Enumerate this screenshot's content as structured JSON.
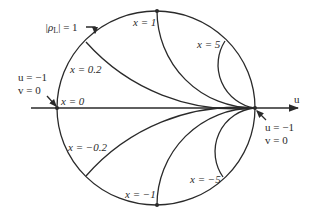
{
  "diagram": {
    "type": "smith-chart-reactance-circles",
    "axis": {
      "u_label": "u"
    },
    "unit_circle_label": "|ρL| = 1",
    "unit_circle_label_parts": {
      "rho": "|ρ",
      "sub": "L",
      "rest": "| = 1"
    },
    "left_point": {
      "u_label": "u = −1",
      "v_label": "v = 0"
    },
    "right_point": {
      "u_label": "u = −1",
      "v_label": "v = 0"
    },
    "reactance_labels": {
      "x0": "x = 0",
      "x0_2": "x = 0.2",
      "x1": "x = 1",
      "x5": "x = 5",
      "xm0_2": "x = −0.2",
      "xm1": "x = −1",
      "xm5": "x = −5"
    },
    "colors": {
      "line": "#2a2a2a",
      "background": "#ffffff"
    }
  }
}
